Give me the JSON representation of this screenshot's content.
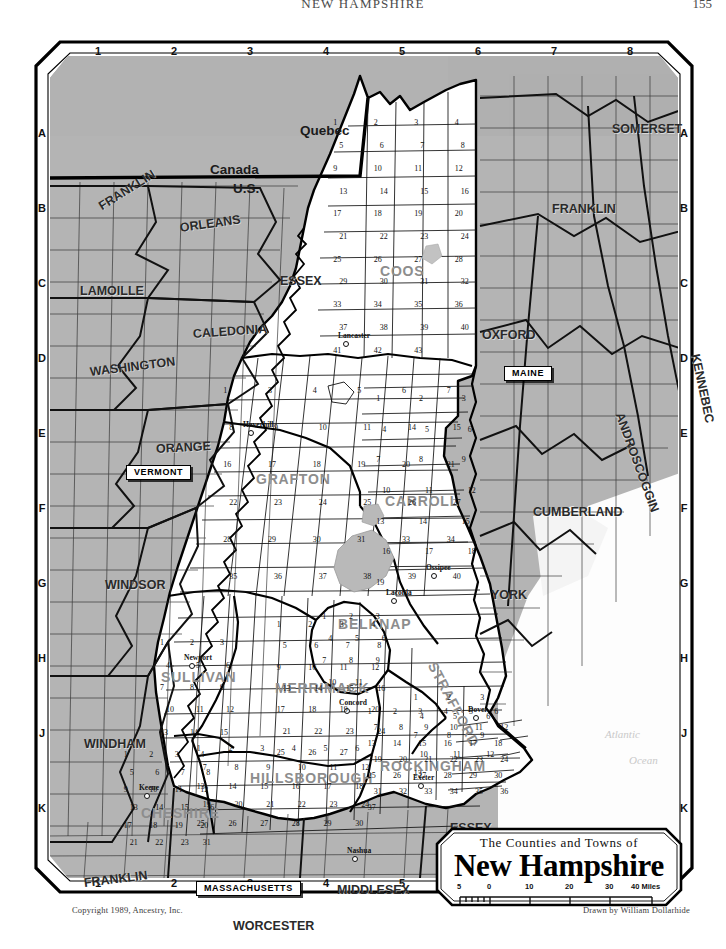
{
  "page": {
    "running_head": "NEW HAMPSHIRE",
    "page_number": "155",
    "copyright": "Copyright 1989, Ancestry, Inc.",
    "drawn_by": "Drawn by William Dollarhide"
  },
  "cartouche": {
    "subtitle": "The Counties and Towns of",
    "title": "New Hampshire",
    "scale_ticks": [
      "5",
      "0",
      "10",
      "20",
      "30",
      "40 Miles"
    ]
  },
  "neatline": {
    "top_numbers": [
      "1",
      "2",
      "3",
      "4",
      "5",
      "6",
      "7",
      "8"
    ],
    "bottom_numbers": [
      "1",
      "2",
      "3",
      "4",
      "5",
      "6",
      "7",
      "8"
    ],
    "left_letters": [
      "A",
      "B",
      "C",
      "D",
      "E",
      "F",
      "G",
      "H",
      "J",
      "K"
    ],
    "right_letters": [
      "A",
      "B",
      "C",
      "D",
      "E",
      "F",
      "G",
      "H",
      "J",
      "K"
    ]
  },
  "nations": [
    {
      "name": "Quebec",
      "x": 272,
      "y": 88
    },
    {
      "name": "Canada",
      "x": 182,
      "y": 127
    },
    {
      "name": "U.S.",
      "x": 205,
      "y": 146
    }
  ],
  "state_tags": [
    {
      "name": "VERMONT",
      "x": 98,
      "y": 429
    },
    {
      "name": "MAINE",
      "x": 476,
      "y": 330
    },
    {
      "name": "MASSACHUSETTS",
      "x": 168,
      "y": 845
    }
  ],
  "outside_counties": [
    {
      "name": "FRANKLIN",
      "x": 72,
      "y": 165,
      "rot": -32
    },
    {
      "name": "ORLEANS",
      "x": 152,
      "y": 186,
      "rot": -8
    },
    {
      "name": "ESSEX",
      "x": 252,
      "y": 239,
      "rot": 0
    },
    {
      "name": "LAMOILLE",
      "x": 52,
      "y": 249,
      "rot": 0
    },
    {
      "name": "CALEDONIA",
      "x": 165,
      "y": 292,
      "rot": -4
    },
    {
      "name": "WASHINGTON",
      "x": 62,
      "y": 330,
      "rot": -7
    },
    {
      "name": "ORANGE",
      "x": 128,
      "y": 407,
      "rot": -3
    },
    {
      "name": "WINDSOR",
      "x": 77,
      "y": 543,
      "rot": 0
    },
    {
      "name": "WINDHAM",
      "x": 56,
      "y": 702,
      "rot": 0
    },
    {
      "name": "FRANKLIN",
      "x": 56,
      "y": 841,
      "rot": -7
    },
    {
      "name": "WORCESTER",
      "x": 205,
      "y": 884,
      "rot": 0
    },
    {
      "name": "MIDDLESEX",
      "x": 309,
      "y": 848,
      "rot": 0
    },
    {
      "name": "ESSEX",
      "x": 422,
      "y": 786,
      "rot": 0
    },
    {
      "name": "FRANKLIN",
      "x": 524,
      "y": 167,
      "rot": 0
    },
    {
      "name": "OXFORD",
      "x": 454,
      "y": 293,
      "rot": 0
    },
    {
      "name": "KENNEBEC",
      "x": 667,
      "y": 312,
      "rot": 78
    },
    {
      "name": "ANDROSCOGGIN",
      "x": 591,
      "y": 371,
      "rot": 70
    },
    {
      "name": "CUMBERLAND",
      "x": 505,
      "y": 470,
      "rot": 0
    },
    {
      "name": "YORK",
      "x": 463,
      "y": 553,
      "rot": 0
    },
    {
      "name": "SOMERSET",
      "x": 584,
      "y": 87,
      "rot": 0
    }
  ],
  "nh_counties": [
    {
      "name": "COOS",
      "x": 352,
      "y": 228,
      "rot": 0
    },
    {
      "name": "GRAFTON",
      "x": 228,
      "y": 436,
      "rot": 0
    },
    {
      "name": "CARROLL",
      "x": 357,
      "y": 458,
      "rot": 0
    },
    {
      "name": "BELKNAP",
      "x": 310,
      "y": 581,
      "rot": 0
    },
    {
      "name": "STRAFFORD",
      "x": 404,
      "y": 620,
      "rot": 62
    },
    {
      "name": "MERRIMACK",
      "x": 247,
      "y": 645,
      "rot": 0
    },
    {
      "name": "SULLIVAN",
      "x": 133,
      "y": 634,
      "rot": 0
    },
    {
      "name": "HILLSBOROUGH",
      "x": 222,
      "y": 735,
      "rot": 0
    },
    {
      "name": "ROCKINGHAM",
      "x": 352,
      "y": 723,
      "rot": 0
    },
    {
      "name": "CHESHIRE",
      "x": 113,
      "y": 770,
      "rot": 0
    }
  ],
  "cities": [
    {
      "name": "Lancaster",
      "x": 310,
      "y": 296
    },
    {
      "name": "Haverhill",
      "x": 215,
      "y": 385
    },
    {
      "name": "Laconia",
      "x": 358,
      "y": 553
    },
    {
      "name": "Ossipee",
      "x": 398,
      "y": 528
    },
    {
      "name": "Newport",
      "x": 156,
      "y": 618
    },
    {
      "name": "Concord",
      "x": 311,
      "y": 663
    },
    {
      "name": "Dover",
      "x": 440,
      "y": 670
    },
    {
      "name": "Exeter",
      "x": 385,
      "y": 738
    },
    {
      "name": "Keene",
      "x": 111,
      "y": 748
    },
    {
      "name": "Nashua",
      "x": 319,
      "y": 811
    }
  ],
  "ocean": [
    {
      "name": "Atlantic",
      "x": 577,
      "y": 693
    },
    {
      "name": "Ocean",
      "x": 601,
      "y": 719
    }
  ],
  "town_numbers": {
    "coos": [
      "1",
      "2",
      "3",
      "4",
      "5",
      "6",
      "7",
      "8",
      "9",
      "10",
      "11",
      "12",
      "13",
      "14",
      "15",
      "16",
      "17",
      "18",
      "19",
      "20",
      "21",
      "22",
      "23",
      "24",
      "25",
      "26",
      "27",
      "28",
      "29",
      "30",
      "31",
      "32",
      "33",
      "34",
      "35",
      "36",
      "37",
      "38",
      "39",
      "40",
      "41",
      "42",
      "43"
    ],
    "grafton": [
      "1",
      "3",
      "4",
      "5",
      "6",
      "7",
      "8",
      "9",
      "10",
      "11",
      "14",
      "15",
      "16",
      "17",
      "18",
      "19",
      "20",
      "21",
      "22",
      "23",
      "24",
      "25",
      "26",
      "27",
      "28",
      "29",
      "30",
      "31",
      "33",
      "34",
      "35",
      "36",
      "37",
      "38",
      "39",
      "40"
    ],
    "carroll": [
      "1",
      "2",
      "3",
      "4",
      "5",
      "6",
      "7",
      "8",
      "9",
      "10",
      "11",
      "12",
      "13",
      "14",
      "15",
      "16",
      "17",
      "18",
      "19"
    ],
    "belknap": [
      "1",
      "2",
      "3",
      "4",
      "5",
      "6",
      "7",
      "8",
      "9",
      "10",
      "11"
    ],
    "strafford": [
      "1",
      "2",
      "3",
      "4",
      "5",
      "6",
      "7",
      "8",
      "9",
      "10",
      "11",
      "12",
      "13"
    ],
    "merrimack": [
      "1",
      "2",
      "3",
      "4",
      "5",
      "6",
      "7",
      "8",
      "9",
      "10",
      "11",
      "12",
      "13",
      "14",
      "15",
      "16",
      "17",
      "18",
      "19",
      "20",
      "21",
      "22",
      "23",
      "24",
      "25",
      "26",
      "27"
    ],
    "sullivan": [
      "1",
      "2",
      "3",
      "4",
      "5",
      "6",
      "7",
      "8",
      "9",
      "10",
      "11",
      "12",
      "13",
      "14",
      "15"
    ],
    "hillsborough": [
      "1",
      "2",
      "3",
      "4",
      "5",
      "6",
      "7",
      "8",
      "9",
      "10",
      "11",
      "12",
      "13",
      "14",
      "15",
      "16",
      "17",
      "18",
      "19",
      "20",
      "21",
      "22",
      "23",
      "24",
      "25",
      "26",
      "27",
      "28",
      "29",
      "30",
      "31"
    ],
    "rockingham": [
      "1",
      "2",
      "3",
      "4",
      "5",
      "6",
      "7",
      "8",
      "9",
      "10",
      "11",
      "12",
      "13",
      "14",
      "15",
      "16",
      "17",
      "18",
      "19",
      "20",
      "21",
      "22",
      "23",
      "24",
      "25",
      "26",
      "27",
      "28",
      "29",
      "30",
      "31",
      "32",
      "33",
      "34",
      "35",
      "36",
      "37"
    ],
    "cheshire": [
      "1",
      "2",
      "3",
      "4",
      "5",
      "6",
      "7",
      "8",
      "9",
      "10",
      "11",
      "12",
      "13",
      "14",
      "15",
      "16",
      "17",
      "18",
      "19",
      "20",
      "21",
      "22",
      "23"
    ]
  },
  "colors": {
    "land_nh": "#ffffff",
    "land_neighbor": "#b4b4b4",
    "border": "#000000",
    "ocean_text": "#c9c9c9",
    "county_ghost": "#8d8d8d"
  }
}
